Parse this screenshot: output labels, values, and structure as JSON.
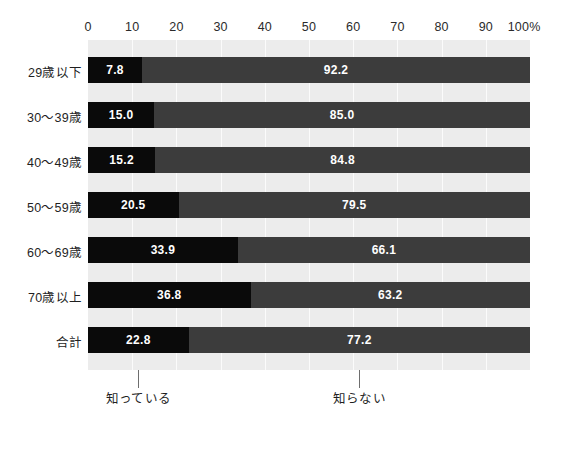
{
  "chart_data": {
    "type": "bar",
    "title": "",
    "subtitle": "",
    "xlabel": "",
    "ylabel": "",
    "orientation": "horizontal",
    "stacked": true,
    "normalized_100": true,
    "xlim": [
      0,
      100
    ],
    "grid": true,
    "grid_axis": "x",
    "legend_position": "bottom",
    "axis_unit": "%",
    "categories": [
      "29歳以下",
      "30〜39歳",
      "40〜49歳",
      "50〜59歳",
      "60〜69歳",
      "70歳以上",
      "合計"
    ],
    "tick_labels": [
      "0",
      "10",
      "20",
      "30",
      "40",
      "50",
      "60",
      "70",
      "80",
      "90",
      "100%"
    ],
    "tick_values": [
      0,
      10,
      20,
      30,
      40,
      50,
      60,
      70,
      80,
      90,
      100
    ],
    "series": [
      {
        "name": "知っている",
        "color": "#0a0a0a",
        "values": [
          7.8,
          15.0,
          15.2,
          20.5,
          33.9,
          36.8,
          22.8
        ],
        "labels": [
          "7.8",
          "15.0",
          "15.2",
          "20.5",
          "33.9",
          "36.8",
          "22.8"
        ]
      },
      {
        "name": "知らない",
        "color": "#3c3c3c",
        "values": [
          92.2,
          85.0,
          84.8,
          79.5,
          66.1,
          63.2,
          77.2
        ],
        "labels": [
          "92.2",
          "85.0",
          "84.8",
          "79.5",
          "66.1",
          "63.2",
          "77.2"
        ]
      }
    ],
    "annotations": [
      {
        "text": "知っている",
        "anchor_pct": 11.4,
        "points_to": "合計-知っている-segment"
      },
      {
        "text": "知らない",
        "anchor_pct": 61.4,
        "points_to": "合計-知らない-segment"
      }
    ]
  },
  "colors": {
    "plot_background": "#ececec",
    "page_background": "#ffffff",
    "gridline": "#fbfbfb",
    "know": "#0a0a0a",
    "unknow": "#3c3c3c",
    "label_text": "#1f1f1f",
    "value_text": "#ffffff",
    "leader_line": "#6e6e6e"
  }
}
